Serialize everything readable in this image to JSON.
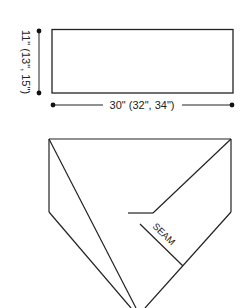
{
  "diagram": {
    "rectangle": {
      "width_label": "30\" (32\", 34\")",
      "height_label": "11\" (13\", 15\")"
    },
    "assembled": {
      "seam_label": "SEAM"
    }
  },
  "colors": {
    "line": "#222222",
    "background": "#ffffff"
  }
}
